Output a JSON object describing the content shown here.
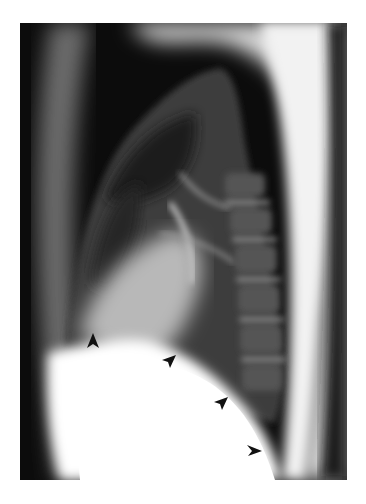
{
  "image": {
    "type": "radiograph",
    "view": "lateral chest",
    "background": "#ffffff",
    "film_tone": "#0b0b0b",
    "arrowhead_color": "#111111",
    "arrowheads": [
      {
        "id": 1,
        "x": 93,
        "y": 338,
        "direction": "up"
      },
      {
        "id": 2,
        "x": 168,
        "y": 358,
        "direction": "up-right"
      },
      {
        "id": 3,
        "x": 219,
        "y": 400,
        "direction": "up-right"
      },
      {
        "id": 4,
        "x": 254,
        "y": 452,
        "direction": "right"
      }
    ]
  }
}
